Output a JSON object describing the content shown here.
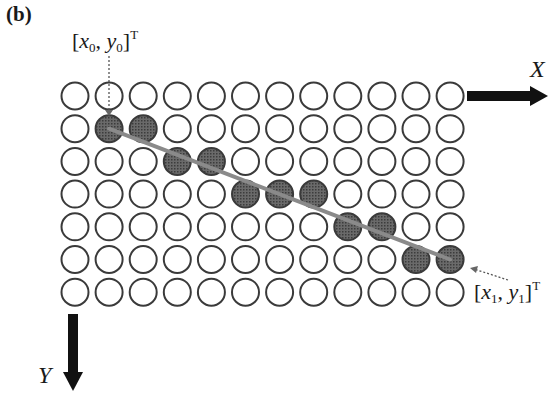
{
  "panel_label": "(b)",
  "grid": {
    "cols": 12,
    "rows": 7,
    "origin_x": 75,
    "origin_y": 96,
    "dx": 34.1,
    "dy": 32.7,
    "radius": 13.5,
    "filled": [
      [
        1,
        1
      ],
      [
        1,
        2
      ],
      [
        2,
        3
      ],
      [
        2,
        4
      ],
      [
        3,
        5
      ],
      [
        3,
        6
      ],
      [
        3,
        7
      ],
      [
        4,
        8
      ],
      [
        4,
        9
      ],
      [
        5,
        10
      ],
      [
        5,
        11
      ]
    ]
  },
  "colors": {
    "stroke": "#3a3a3a",
    "fill_filled": "#5a5a5a",
    "line": "#8a8a8a",
    "arrow": "#111111"
  },
  "start_point": {
    "var_x": "x",
    "sub_x": "0",
    "var_y": "y",
    "sub_y": "0",
    "sup": "T"
  },
  "end_point": {
    "var_x": "x",
    "sub_x": "1",
    "var_y": "y",
    "sub_y": "1",
    "sup": "T"
  },
  "axes": {
    "x_label": "X",
    "y_label": "Y"
  }
}
